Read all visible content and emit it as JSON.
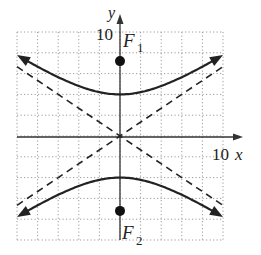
{
  "chart_data": {
    "type": "line",
    "title": "",
    "xlabel": "x",
    "ylabel": "y",
    "xlim": [
      -10,
      10
    ],
    "ylim": [
      -10,
      10
    ],
    "grid": true,
    "grid_step": 2,
    "tick_labels": {
      "x": "10",
      "y": "10"
    },
    "equation": "y^2/16 - x^2/36 = 1",
    "series": [
      {
        "name": "hyperbola-upper-branch",
        "style": "solid",
        "points": [
          [
            -10,
            7.78
          ],
          [
            -6,
            5.66
          ],
          [
            -3,
            4.47
          ],
          [
            0,
            4
          ],
          [
            3,
            4.47
          ],
          [
            6,
            5.66
          ],
          [
            10,
            7.78
          ]
        ]
      },
      {
        "name": "hyperbola-lower-branch",
        "style": "solid",
        "points": [
          [
            -10,
            -7.78
          ],
          [
            -6,
            -5.66
          ],
          [
            -3,
            -4.47
          ],
          [
            0,
            -4
          ],
          [
            3,
            -4.47
          ],
          [
            6,
            -5.66
          ],
          [
            10,
            -7.78
          ]
        ]
      },
      {
        "name": "asymptote-positive",
        "style": "dashed",
        "equation": "y = (2/3)x",
        "points": [
          [
            -10,
            -6.67
          ],
          [
            10,
            6.67
          ]
        ]
      },
      {
        "name": "asymptote-negative",
        "style": "dashed",
        "equation": "y = -(2/3)x",
        "points": [
          [
            -10,
            6.67
          ],
          [
            10,
            -6.67
          ]
        ]
      }
    ],
    "annotations": [
      {
        "label": "F",
        "subscript": "1",
        "point": [
          0,
          7.2
        ]
      },
      {
        "label": "F",
        "subscript": "2",
        "point": [
          0,
          -7.2
        ]
      }
    ]
  },
  "labels": {
    "x_axis": "x",
    "y_axis": "y",
    "x_tick": "10",
    "y_tick": "10",
    "focus1": "F",
    "focus1_sub": "1",
    "focus2": "F",
    "focus2_sub": "2"
  },
  "colors": {
    "curve": "#222222",
    "grid": "#9a9a9a",
    "axis": "#333333"
  }
}
